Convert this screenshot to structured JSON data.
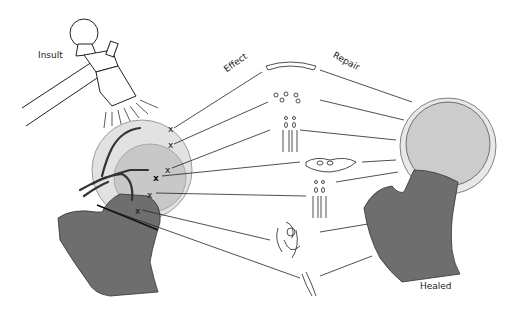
{
  "figure": {
    "labels": {
      "insult": "Insult",
      "effect": "Effect",
      "repair": "Repair",
      "healed": "Healed"
    },
    "colors": {
      "bone_dark": "#6e6e6e",
      "head_light": "#dcdcdc",
      "head_mid": "#c4c4c4",
      "line": "#222222",
      "background": "#ffffff"
    },
    "elements": [
      "hammer-icon",
      "injured-femoral-head",
      "injury-markers-x",
      "effect-tissue-glyphs",
      "healed-femoral-head"
    ]
  }
}
